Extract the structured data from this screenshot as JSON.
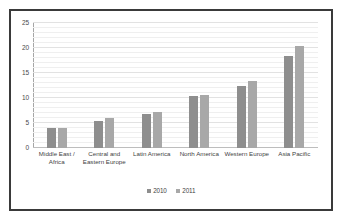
{
  "chart_data": {
    "type": "bar",
    "title": "",
    "subtitle": "",
    "xlabel": "",
    "ylabel": "",
    "ylim": [
      0,
      25
    ],
    "yticks": [
      0,
      5,
      10,
      15,
      20,
      25
    ],
    "ytick_labels": [
      "0",
      "5",
      "10",
      "15",
      "20",
      "25"
    ],
    "grid": true,
    "legend_position": "bottom",
    "categories": [
      "Middle East / Africa",
      "Central and Eastern Europe",
      "Latin America",
      "North America",
      "Western Europe",
      "Asia Pacific"
    ],
    "series": [
      {
        "name": "2010",
        "color": "#8e8e8e",
        "values": [
          4.0,
          5.4,
          6.8,
          10.4,
          12.5,
          18.4
        ]
      },
      {
        "name": "2011",
        "color": "#a8a8a8",
        "values": [
          4.0,
          6.0,
          7.3,
          10.7,
          13.5,
          20.5
        ]
      }
    ]
  },
  "colors": {
    "series_2010": "#8e8e8e",
    "series_2011": "#a8a8a8",
    "frame_border": "#3a3a3a",
    "gridline": "#efefef",
    "axis": "#a6a6a6",
    "background": "#ffffff",
    "text": "#3f3f3f"
  }
}
